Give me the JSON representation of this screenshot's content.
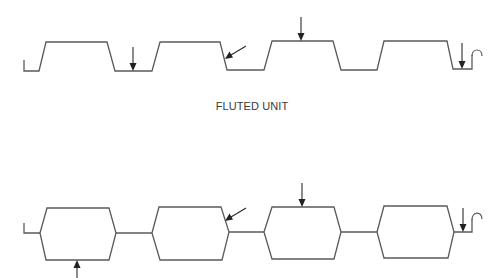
{
  "diagram": {
    "colors": {
      "line": "#5a5a5a",
      "arrow": "#222222",
      "background": "#ffffff"
    },
    "top_profile": {
      "label": "FLUTED UNIT",
      "shape": "trapezoidal fluted profile",
      "flutes": 4,
      "arrows": [
        {
          "type": "vertical-down",
          "position": "bottom flange between flute 1 and 2"
        },
        {
          "type": "diagonal",
          "position": "right web of flute 2"
        },
        {
          "type": "vertical-down",
          "position": "top of flute 3"
        },
        {
          "type": "vertical-down",
          "position": "end bottom flange"
        }
      ],
      "end_detail": "hook"
    },
    "bottom_profile": {
      "label": "",
      "shape": "hexagonal cellular profile",
      "cells": 4,
      "arrows": [
        {
          "type": "vertical-up",
          "position": "bottom of cell 1"
        },
        {
          "type": "diagonal",
          "position": "upper right web of cell 2"
        },
        {
          "type": "vertical-down",
          "position": "top of cell 3"
        },
        {
          "type": "vertical-down",
          "position": "end connector"
        }
      ],
      "end_detail": "hook"
    }
  }
}
